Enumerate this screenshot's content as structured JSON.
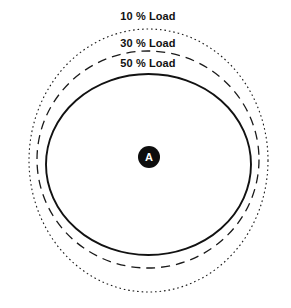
{
  "figure": {
    "background_color": "#ffffff",
    "width": 291,
    "height": 308,
    "stroke_color": "#1a1a1a",
    "label_color": "#111111"
  },
  "node": {
    "label": "A",
    "cx": 149,
    "cy": 157,
    "radius": 11,
    "fill": "#0d0d0d",
    "text_color": "#ffffff"
  },
  "contours": [
    {
      "key": "load-10",
      "label": "10 % Load",
      "load_percent": 10,
      "line_style": "dotted",
      "cx": 148.5,
      "cy": 160.5,
      "rx": 119.5,
      "ry": 131.5,
      "label_x": 148,
      "label_y": 10
    },
    {
      "key": "load-30",
      "label": "30 % Load",
      "load_percent": 30,
      "line_style": "dashed",
      "cx": 148,
      "cy": 159.5,
      "rx": 111,
      "ry": 108.5,
      "label_x": 148,
      "label_y": 37
    },
    {
      "key": "load-50",
      "label": "50 % Load",
      "load_percent": 50,
      "line_style": "solid",
      "cx": 148.5,
      "cy": 164.5,
      "rx": 102.5,
      "ry": 90.5,
      "label_x": 148,
      "label_y": 57
    }
  ],
  "chart_data": {
    "type": "scatter",
    "title": "",
    "xlabel": "",
    "ylabel": "",
    "legend_position": "inline-top",
    "grid": false,
    "center_node": "A",
    "categories": [
      "10 % Load",
      "30 % Load",
      "50 % Load"
    ],
    "series": [
      {
        "name": "coverage radius (px)",
        "values": [
          131,
          109,
          91
        ]
      }
    ],
    "annotations": [
      "10 % Load",
      "30 % Load",
      "50 % Load",
      "A"
    ]
  }
}
